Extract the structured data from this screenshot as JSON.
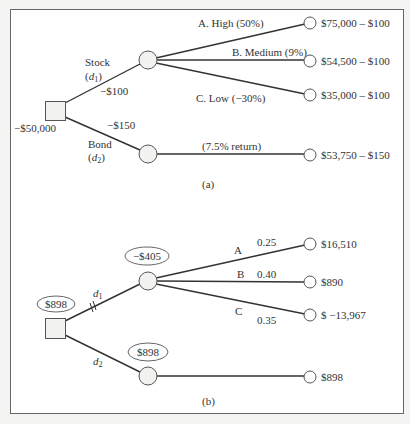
{
  "panel_a": {
    "caption": "(a)",
    "decision": {
      "label": "−$50,000"
    },
    "branches": {
      "stock": {
        "name": "Stock",
        "var": "d",
        "sub": "1",
        "cost": "−$100"
      },
      "bond": {
        "name": "Bond",
        "var": "d",
        "sub": "2",
        "cost": "−$150"
      }
    },
    "stock_outcomes": [
      {
        "label": "A. High (50%)",
        "payoff": "$75,000 – $100"
      },
      {
        "label": "B. Medium (9%)",
        "payoff": "$54,500 – $100"
      },
      {
        "label": "C. Low (−30%)",
        "payoff": "$35,000 – $100"
      }
    ],
    "bond_outcome": {
      "label": "(7.5% return)",
      "payoff": "$53,750 – $150"
    }
  },
  "panel_b": {
    "caption": "(b)",
    "decision": {
      "value": "$898"
    },
    "branches": {
      "d1": {
        "var": "d",
        "sub": "1",
        "value": "−$405"
      },
      "d2": {
        "var": "d",
        "sub": "2",
        "value": "$898"
      }
    },
    "d1_outcomes": [
      {
        "label": "A",
        "prob": "0.25",
        "payoff": "$16,510"
      },
      {
        "label": "B",
        "prob": "0.40",
        "payoff": "$890"
      },
      {
        "label": "C",
        "prob": "0.35",
        "payoff": "$ −13,967"
      }
    ],
    "d2_outcome": {
      "payoff": "$898"
    }
  },
  "colors": {
    "line": "#333333",
    "node_fill": "#f2f2f0",
    "border": "#555555",
    "background": "#ffffff"
  }
}
